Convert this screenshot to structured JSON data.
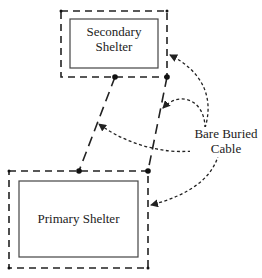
{
  "diagram": {
    "secondary_shelter": {
      "label_line1": "Secondary",
      "label_line2": "Shelter"
    },
    "primary_shelter": {
      "label": "Primary Shelter"
    },
    "annotation": {
      "line1": "Bare Buried",
      "line2": "Cable"
    },
    "colors": {
      "stroke": "#222222",
      "background": "#ffffff"
    }
  }
}
